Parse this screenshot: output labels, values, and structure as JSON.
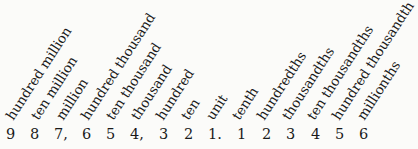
{
  "diagram": {
    "places": [
      {
        "label": "hundred million",
        "digit": "9",
        "x": 6
      },
      {
        "label": "ten million",
        "digit": "8",
        "x": 30
      },
      {
        "label": "million",
        "digit": "7,",
        "x": 54
      },
      {
        "label": "hundred thousand",
        "digit": "6",
        "x": 82
      },
      {
        "label": "ten thousand",
        "digit": "5",
        "x": 106
      },
      {
        "label": "thousand",
        "digit": "4,",
        "x": 130
      },
      {
        "label": "hundred",
        "digit": "3",
        "x": 159
      },
      {
        "label": "ten",
        "digit": "2",
        "x": 184
      },
      {
        "label": "unit",
        "digit": "1.",
        "x": 208
      },
      {
        "label": "tenth",
        "digit": "1",
        "x": 237
      },
      {
        "label": "hundredths",
        "digit": "2",
        "x": 262
      },
      {
        "label": "thousandths",
        "digit": "3",
        "x": 286
      },
      {
        "label": "ten thousandths",
        "digit": "4",
        "x": 311
      },
      {
        "label": "hundred thousandth",
        "digit": "5",
        "x": 335
      },
      {
        "label": "millionths",
        "digit": "6",
        "x": 359
      }
    ]
  }
}
